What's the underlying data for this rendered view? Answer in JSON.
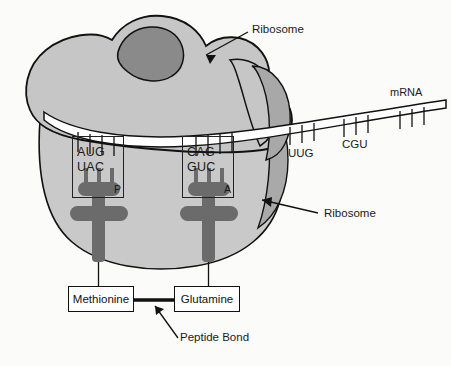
{
  "figure": {
    "background_color": "#fbfbfa",
    "ink_color": "#111111"
  },
  "colors": {
    "large_subunit": "#c6c6c6",
    "small_subunit": "#c9c9c9",
    "dark_blob": "#8a8a8a",
    "shaded_lobe": "#a8a8a8",
    "trna": "#6b6b6b",
    "mrna_strand": "#ffffff",
    "outline": "#111111"
  },
  "annotations": {
    "ribosome_top": "Ribosome",
    "ribosome_bottom": "Ribosome",
    "mrna": "mRNA",
    "peptide_bond": "Peptide Bond"
  },
  "sites": {
    "p_site": {
      "label": "P",
      "codon": "AUG",
      "anticodon": "UAC",
      "amino_acid": "Methionine"
    },
    "a_site": {
      "label": "A",
      "codon": "CAG",
      "anticodon": "GUC",
      "amino_acid": "Glutamine"
    }
  },
  "mrna_codons": [
    {
      "label": "UUG",
      "ticks": 3
    },
    {
      "label": "CGU",
      "ticks": 3
    },
    {
      "label": "",
      "ticks": 3
    }
  ]
}
